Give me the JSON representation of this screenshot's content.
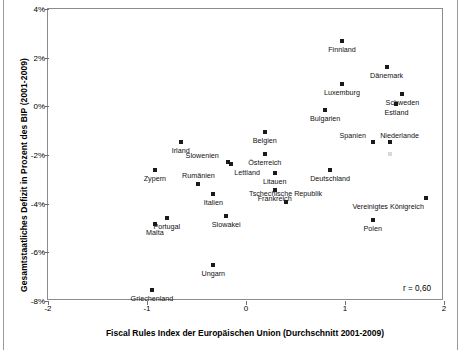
{
  "chart_data": {
    "type": "scatter",
    "title": "",
    "xlabel": "Fiscal Rules Index der Europäischen Union (Durchschnitt 2001-2009)",
    "ylabel": "Gesamtstaatliches Defizit in Prozent des BIP (2001-2009)",
    "xlim": [
      -2,
      2
    ],
    "ylim": [
      -8,
      4
    ],
    "xticks": [
      "-2",
      "-1",
      "0",
      "1",
      "2"
    ],
    "xtick_values": [
      -2,
      -1,
      0,
      1,
      2
    ],
    "yticks": [
      "4%",
      "2%",
      "0%",
      "-2%",
      "-4%",
      "-6%",
      "-8%"
    ],
    "ytick_values": [
      4,
      2,
      0,
      -2,
      -4,
      -6,
      -8
    ],
    "grid": false,
    "legend": null,
    "annotation": "r = 0,60",
    "correlation": 0.6,
    "points": [
      {
        "label": "Finnland",
        "x": 0.97,
        "y": 2.7,
        "label_pos": "below"
      },
      {
        "label": "Dänemark",
        "x": 1.42,
        "y": 1.6,
        "label_pos": "below"
      },
      {
        "label": "Luxemburg",
        "x": 0.97,
        "y": 0.9,
        "label_pos": "below"
      },
      {
        "label": "Schweden",
        "x": 1.58,
        "y": 0.52,
        "label_pos": "below"
      },
      {
        "label": "Estland",
        "x": 1.52,
        "y": 0.1,
        "label_pos": "below"
      },
      {
        "label": "Bulgarien",
        "x": 0.8,
        "y": -0.15,
        "label_pos": "below"
      },
      {
        "label": "Spanien",
        "x": 1.28,
        "y": -1.45,
        "label_pos": "left"
      },
      {
        "label": "Niederlande",
        "x": 1.45,
        "y": -1.45,
        "label_pos": "above-right"
      },
      {
        "label": "Belgien",
        "x": 0.19,
        "y": -1.07,
        "label_pos": "below"
      },
      {
        "label": "Österreich",
        "x": 0.19,
        "y": -1.95,
        "label_pos": "below"
      },
      {
        "label": "Irland",
        "x": -0.66,
        "y": -1.48,
        "label_pos": "below"
      },
      {
        "label": "Slowenien",
        "x": -0.18,
        "y": -2.3,
        "label_pos": "left-above"
      },
      {
        "label": "Lettland",
        "x": -0.15,
        "y": -2.35,
        "label_pos": "below-right"
      },
      {
        "label": "Litauen",
        "x": 0.29,
        "y": -2.72,
        "label_pos": "below"
      },
      {
        "label": "Deutschland",
        "x": 0.85,
        "y": -2.6,
        "label_pos": "below"
      },
      {
        "label": "Zypern",
        "x": -0.92,
        "y": -2.6,
        "label_pos": "below"
      },
      {
        "label": "Rumänien",
        "x": -0.48,
        "y": -3.18,
        "label_pos": "above"
      },
      {
        "label": "Italien",
        "x": -0.33,
        "y": -3.62,
        "label_pos": "below"
      },
      {
        "label": "Frankreich",
        "x": 0.29,
        "y": -3.45,
        "label_pos": "below"
      },
      {
        "label": "Tschechische Republik",
        "x": 0.4,
        "y": -3.95,
        "label_pos": "above"
      },
      {
        "label": "Vereinigtes Königreich",
        "x": 1.82,
        "y": -3.75,
        "label_pos": "below-left"
      },
      {
        "label": "Slowakei",
        "x": -0.2,
        "y": -4.5,
        "label_pos": "below"
      },
      {
        "label": "Portugal",
        "x": -0.8,
        "y": -4.58,
        "label_pos": "below"
      },
      {
        "label": "Polen",
        "x": 1.28,
        "y": -4.68,
        "label_pos": "below"
      },
      {
        "label": "Malta",
        "x": -0.92,
        "y": -4.85,
        "label_pos": "below"
      },
      {
        "label": "Ungarn",
        "x": -0.33,
        "y": -6.5,
        "label_pos": "below"
      },
      {
        "label": "Griechenland",
        "x": -0.95,
        "y": -7.55,
        "label_pos": "below"
      }
    ]
  }
}
